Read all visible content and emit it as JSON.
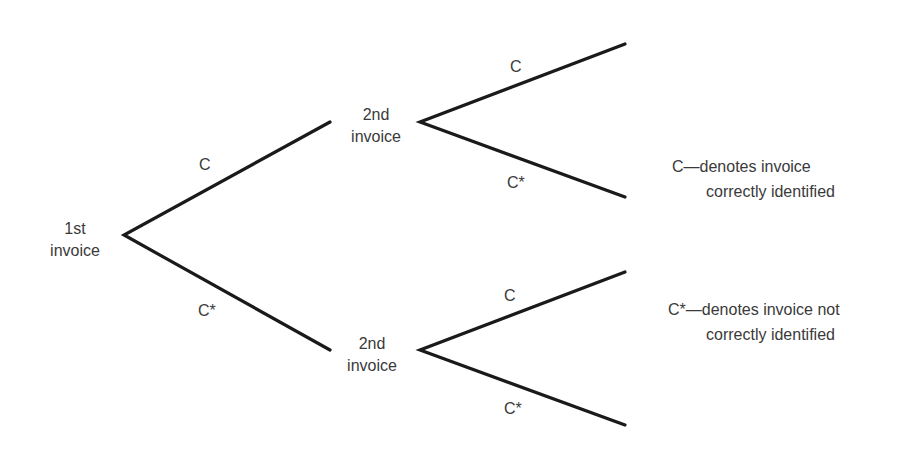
{
  "diagram": {
    "type": "probability-tree",
    "line_color": "#1a1a1a",
    "text_color": "#3a3a3a",
    "nodes": {
      "root": {
        "line1": "1st",
        "line2": "invoice"
      },
      "top": {
        "line1": "2nd",
        "line2": "invoice"
      },
      "bottom": {
        "line1": "2nd",
        "line2": "invoice"
      }
    },
    "branches": {
      "root_upper": "C",
      "root_lower": "C*",
      "top_upper": "C",
      "top_lower": "C*",
      "bottom_upper": "C",
      "bottom_lower": "C*"
    },
    "legend": [
      {
        "symbol": "C",
        "dash": "—",
        "line1": "denotes invoice",
        "line2": "correctly identified"
      },
      {
        "symbol": "C*",
        "dash": "—",
        "line1": "denotes invoice not",
        "line2": "correctly identified"
      }
    ]
  }
}
